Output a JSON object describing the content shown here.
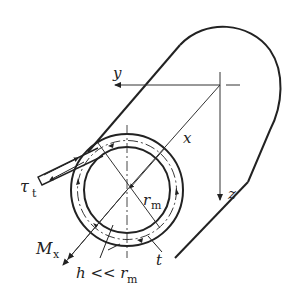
{
  "figure": {
    "colors": {
      "stroke": "#222222",
      "background": "#ffffff"
    }
  },
  "labels": {
    "y_axis": "y",
    "x_axis": "x",
    "z_axis": "z",
    "tau_symbol": "τ",
    "tau_sub": "t",
    "r_symbol": "r",
    "r_sub": "m",
    "moment_symbol": "M",
    "moment_sub": "x",
    "thickness": "t",
    "condition_h": "h << r",
    "condition_sub": "m"
  }
}
